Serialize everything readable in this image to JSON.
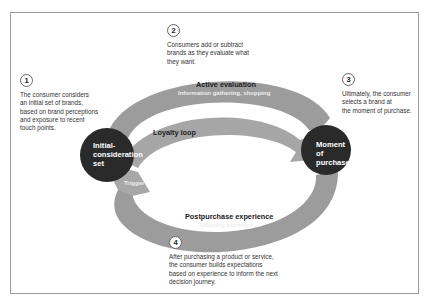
{
  "diagram": {
    "colors": {
      "loop_fill": "#9c9c9c",
      "node_fill": "#2a2a2a",
      "frame_border": "#9a9a9a",
      "text": "#333333"
    },
    "nodes": [
      {
        "id": "initial",
        "label_lines": [
          "Initial-",
          "consideration",
          "set"
        ]
      },
      {
        "id": "moment",
        "label_lines": [
          "Moment",
          "of",
          "purchase"
        ]
      }
    ],
    "loops": {
      "active_evaluation": {
        "title": "Active evaluation",
        "subtitle": "Information gathering, shopping"
      },
      "loyalty_loop": {
        "title": "Loyalty loop"
      },
      "postpurchase": {
        "title": "Postpurchase experience",
        "subtitle": "Ongoing exposure"
      },
      "trigger": {
        "title": "Trigger"
      }
    },
    "steps": [
      {
        "number": "1",
        "text": [
          "The consumer considers",
          "an initial set of brands,",
          "based on brand perceptions",
          "and exposure to recent",
          "touch points."
        ]
      },
      {
        "number": "2",
        "text": [
          "Consumers add or subtract",
          "brands as they evaluate what",
          "they want."
        ]
      },
      {
        "number": "3",
        "text": [
          "Ultimately, the consumer",
          "selects a brand at",
          "the moment of purchase."
        ]
      },
      {
        "number": "4",
        "text": [
          "After purchasing a product or service,",
          "the consumer builds expectations",
          "based on experience to inform the next",
          "decision journey."
        ]
      }
    ]
  }
}
